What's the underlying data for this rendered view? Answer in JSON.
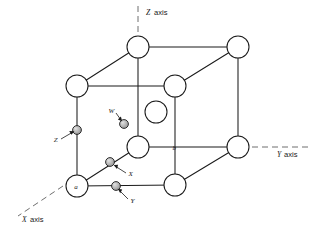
{
  "figure": {
    "axes": [
      {
        "id": "z",
        "label": "Z axis",
        "orientation": "vertical-top"
      },
      {
        "id": "y",
        "label": "Y axis",
        "orientation": "horizontal-right"
      },
      {
        "id": "x",
        "label": "X axis",
        "orientation": "diagonal-lower-left"
      }
    ],
    "corner_labels": [
      {
        "id": "a",
        "label": "a"
      },
      {
        "id": "b",
        "label": "b"
      }
    ],
    "site_labels": [
      {
        "id": "w",
        "label": "W"
      },
      {
        "id": "x",
        "label": "X"
      },
      {
        "id": "y",
        "label": "Y"
      },
      {
        "id": "z",
        "label": "Z"
      }
    ],
    "colors": {
      "line": "#1b1b1b",
      "axis_dash": "#6f6f6f",
      "atom_fill": "#ffffff",
      "small_atom_fill": "#a8a8a8",
      "background": "#ffffff"
    },
    "counts": {
      "large_atoms": 9,
      "small_atoms": 4
    }
  }
}
